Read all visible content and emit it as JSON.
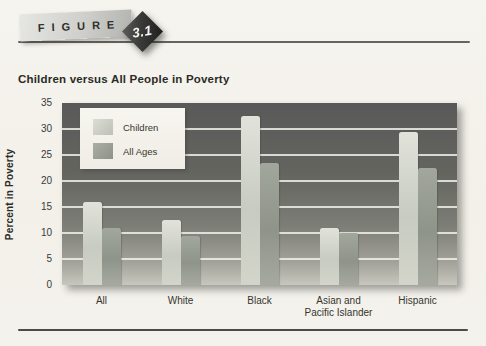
{
  "figure": {
    "label": "FIGURE",
    "number": "3.1",
    "title": "Children versus All People in Poverty"
  },
  "chart_data": {
    "type": "bar",
    "title": "Children versus All People in Poverty",
    "xlabel": "",
    "ylabel": "Percent in Poverty",
    "ylim": [
      0,
      35
    ],
    "yticks": [
      0,
      5,
      10,
      15,
      20,
      25,
      30,
      35
    ],
    "grid": true,
    "legend_position": "upper-left-inside",
    "categories": [
      "All",
      "White",
      "Black",
      "Asian and\nPacific Islander",
      "Hispanic"
    ],
    "series": [
      {
        "name": "Children",
        "color": "#d3d6cc",
        "values": [
          16,
          12.5,
          32.5,
          11,
          29.5
        ]
      },
      {
        "name": "All Ages",
        "color": "#9aa096",
        "values": [
          11,
          9.5,
          23.5,
          10,
          22.5
        ]
      }
    ]
  },
  "colors": {
    "plot_background_top": "#595959",
    "plot_background_bottom": "#c7c7bd",
    "gridline": "#f0f0e9",
    "bar_children": "#d3d6cc",
    "bar_all_ages": "#9aa096",
    "rule": "#4c4c46",
    "text": "#2b2b27",
    "figure_badge": "#2a2a28",
    "page_background": "#f3f1ea"
  }
}
